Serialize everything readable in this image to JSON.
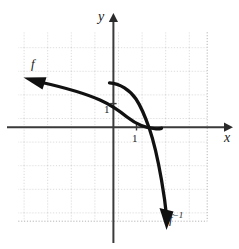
{
  "figure": {
    "kind": "cartesian-plane-graph",
    "width": 239,
    "height": 249,
    "background_color": "#ffffff",
    "ink_color": "#111111",
    "grid_color": "#b9b9b9"
  },
  "axes": {
    "x_label": "x",
    "y_label": "y",
    "origin_label": "",
    "x_tick_label": "1",
    "y_tick_label": "1",
    "x_range": [
      -4,
      4
    ],
    "y_range": [
      -4,
      5
    ],
    "grid": true,
    "grid_style": "dotted",
    "grid_spacing_units": 1,
    "arrowheads": [
      "x-positive",
      "y-positive"
    ]
  },
  "curves": [
    {
      "name": "f",
      "label": "f",
      "description": "shallow decreasing curve entering from upper-left with arrowhead, passing through near (0, 0.9) region and flattening to the right, ending just past the x-axis",
      "arrow_end": "left",
      "points": [
        [
          -3.7,
          1.9
        ],
        [
          -2.8,
          1.65
        ],
        [
          -1.8,
          1.4
        ],
        [
          -0.8,
          1.1
        ],
        [
          0.0,
          0.85
        ],
        [
          0.6,
          0.55
        ],
        [
          1.1,
          0.2
        ],
        [
          1.6,
          -0.03
        ],
        [
          2.0,
          -0.05
        ]
      ]
    },
    {
      "name": "f-inverse",
      "label": "f⁻¹",
      "label_base": "f",
      "label_exponent": "−1",
      "description": "steeply decreasing curve starting near the y-axis around y = 1.9, bending right then plunging down to lower-right with arrowhead",
      "arrow_end": "bottom-right",
      "points": [
        [
          -0.15,
          1.9
        ],
        [
          0.35,
          1.55
        ],
        [
          0.75,
          1.1
        ],
        [
          1.05,
          0.45
        ],
        [
          1.35,
          -0.6
        ],
        [
          1.75,
          -2.0
        ],
        [
          2.05,
          -3.6
        ],
        [
          2.25,
          -4.35
        ]
      ]
    }
  ],
  "labels": {
    "f": "f",
    "f_inverse_base": "f",
    "f_inverse_exponent": "−1",
    "x_axis": "x",
    "y_axis": "y",
    "unit_x": "1",
    "unit_y": "1"
  }
}
